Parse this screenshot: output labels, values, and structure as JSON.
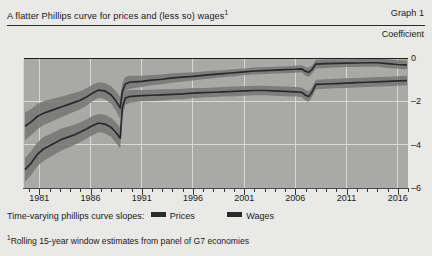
{
  "header": {
    "title": "A flatter Phillips curve for prices and (less so) wages",
    "title_footnote_marker": "1",
    "graph_number": "Graph 1",
    "unit_label": "Coefficient"
  },
  "legend": {
    "label": "Time-varying phillips curve slopes:",
    "entries": [
      {
        "name": "Prices",
        "color": "#2a2a2a"
      },
      {
        "name": "Wages",
        "color": "#2a2a2a"
      }
    ]
  },
  "footnote": {
    "marker": "1",
    "text": "Rolling 15-year window estimates from panel of G7 economies"
  },
  "chart_data": {
    "type": "line",
    "title": "A flatter Phillips curve for prices and (less so) wages",
    "xlabel": "",
    "ylabel": "Coefficient",
    "xlim": [
      1979.5,
      2017.0
    ],
    "ylim": [
      -6,
      0
    ],
    "yticks": [
      0,
      -2,
      -4,
      -6
    ],
    "ytick_labels": [
      "0",
      "–2",
      "–4",
      "–6"
    ],
    "xticks": [
      1981,
      1986,
      1991,
      1996,
      2001,
      2006,
      2011,
      2016
    ],
    "xtick_labels": [
      "1981",
      "1986",
      "1991",
      "1996",
      "2001",
      "2006",
      "2011",
      "2016"
    ],
    "xtick_minor_step": 1,
    "grid": true,
    "grid_color": "#d8d8d6",
    "zero_line": true,
    "legend_position": "below",
    "band_style": "shaded confidence band around central line",
    "series": [
      {
        "name": "Prices",
        "color": "#2a2a2a",
        "band_color": "#767674",
        "x": [
          1979.6,
          1980.2,
          1980.8,
          1981.4,
          1982.0,
          1982.6,
          1983.2,
          1983.8,
          1984.4,
          1985.0,
          1985.6,
          1986.2,
          1986.8,
          1987.4,
          1988.0,
          1988.5,
          1988.9,
          1989.1,
          1989.4,
          1989.8,
          1990.3,
          1991.0,
          1992.0,
          1993.0,
          1994.0,
          1995.0,
          1996.0,
          1997.0,
          1998.0,
          1999.0,
          2000.0,
          2001.0,
          2002.0,
          2003.0,
          2004.0,
          2005.0,
          2006.0,
          2006.6,
          2007.0,
          2007.3,
          2007.6,
          2008.0,
          2009.0,
          2010.0,
          2011.0,
          2012.0,
          2013.0,
          2014.0,
          2015.0,
          2016.0,
          2016.9
        ],
        "central": [
          -3.15,
          -2.95,
          -2.7,
          -2.55,
          -2.45,
          -2.35,
          -2.25,
          -2.15,
          -2.05,
          -1.95,
          -1.8,
          -1.62,
          -1.48,
          -1.52,
          -1.7,
          -2.0,
          -2.3,
          -1.55,
          -1.2,
          -1.12,
          -1.1,
          -1.08,
          -1.02,
          -0.98,
          -0.92,
          -0.88,
          -0.85,
          -0.8,
          -0.76,
          -0.72,
          -0.68,
          -0.64,
          -0.6,
          -0.58,
          -0.56,
          -0.54,
          -0.52,
          -0.5,
          -0.62,
          -0.66,
          -0.55,
          -0.28,
          -0.26,
          -0.25,
          -0.24,
          -0.23,
          -0.22,
          -0.22,
          -0.26,
          -0.3,
          -0.32
        ],
        "lower": [
          -3.8,
          -3.55,
          -3.3,
          -3.1,
          -2.98,
          -2.85,
          -2.72,
          -2.6,
          -2.48,
          -2.36,
          -2.2,
          -2.0,
          -1.84,
          -1.9,
          -2.1,
          -2.45,
          -2.8,
          -1.95,
          -1.52,
          -1.42,
          -1.38,
          -1.34,
          -1.26,
          -1.2,
          -1.14,
          -1.08,
          -1.04,
          -0.98,
          -0.93,
          -0.88,
          -0.84,
          -0.8,
          -0.76,
          -0.74,
          -0.72,
          -0.7,
          -0.68,
          -0.66,
          -0.82,
          -0.88,
          -0.74,
          -0.48,
          -0.46,
          -0.44,
          -0.42,
          -0.41,
          -0.4,
          -0.4,
          -0.46,
          -0.5,
          -0.52
        ],
        "upper": [
          -2.5,
          -2.35,
          -2.12,
          -2.0,
          -1.92,
          -1.85,
          -1.78,
          -1.7,
          -1.62,
          -1.54,
          -1.4,
          -1.24,
          -1.12,
          -1.15,
          -1.3,
          -1.55,
          -1.8,
          -1.15,
          -0.88,
          -0.82,
          -0.82,
          -0.82,
          -0.78,
          -0.76,
          -0.7,
          -0.68,
          -0.66,
          -0.62,
          -0.59,
          -0.56,
          -0.52,
          -0.48,
          -0.44,
          -0.42,
          -0.4,
          -0.38,
          -0.36,
          -0.34,
          -0.42,
          -0.44,
          -0.36,
          -0.08,
          -0.06,
          -0.06,
          -0.06,
          -0.05,
          -0.04,
          -0.04,
          -0.06,
          -0.1,
          -0.12
        ]
      },
      {
        "name": "Wages",
        "color": "#2a2a2a",
        "band_color": "#767674",
        "x": [
          1979.6,
          1980.2,
          1980.8,
          1981.4,
          1982.0,
          1982.6,
          1983.2,
          1983.8,
          1984.4,
          1985.0,
          1985.6,
          1986.2,
          1986.8,
          1987.4,
          1988.0,
          1988.5,
          1988.9,
          1989.1,
          1989.4,
          1989.8,
          1990.3,
          1991.0,
          1992.0,
          1993.0,
          1994.0,
          1995.0,
          1996.0,
          1997.0,
          1998.0,
          1999.0,
          2000.0,
          2001.0,
          2002.0,
          2003.0,
          2004.0,
          2005.0,
          2006.0,
          2006.6,
          2007.0,
          2007.3,
          2007.6,
          2008.0,
          2009.0,
          2010.0,
          2011.0,
          2012.0,
          2013.0,
          2014.0,
          2015.0,
          2016.0,
          2016.9
        ],
        "central": [
          -5.15,
          -4.85,
          -4.45,
          -4.2,
          -4.05,
          -3.9,
          -3.75,
          -3.65,
          -3.55,
          -3.42,
          -3.28,
          -3.12,
          -3.0,
          -3.05,
          -3.2,
          -3.45,
          -3.7,
          -2.3,
          -1.85,
          -1.78,
          -1.76,
          -1.74,
          -1.72,
          -1.7,
          -1.68,
          -1.66,
          -1.62,
          -1.6,
          -1.58,
          -1.56,
          -1.54,
          -1.52,
          -1.5,
          -1.5,
          -1.52,
          -1.54,
          -1.56,
          -1.58,
          -1.72,
          -1.78,
          -1.6,
          -1.22,
          -1.2,
          -1.18,
          -1.16,
          -1.14,
          -1.12,
          -1.1,
          -1.08,
          -1.06,
          -1.04
        ],
        "lower": [
          -5.7,
          -5.4,
          -5.0,
          -4.75,
          -4.58,
          -4.42,
          -4.26,
          -4.14,
          -4.02,
          -3.88,
          -3.72,
          -3.56,
          -3.42,
          -3.48,
          -3.64,
          -3.92,
          -4.18,
          -2.72,
          -2.16,
          -2.08,
          -2.04,
          -2.0,
          -1.98,
          -1.96,
          -1.92,
          -1.9,
          -1.86,
          -1.82,
          -1.8,
          -1.78,
          -1.76,
          -1.74,
          -1.72,
          -1.72,
          -1.74,
          -1.76,
          -1.78,
          -1.8,
          -1.96,
          -2.02,
          -1.82,
          -1.44,
          -1.42,
          -1.4,
          -1.38,
          -1.36,
          -1.34,
          -1.32,
          -1.3,
          -1.28,
          -1.26
        ],
        "upper": [
          -4.6,
          -4.3,
          -3.9,
          -3.65,
          -3.52,
          -3.38,
          -3.24,
          -3.16,
          -3.08,
          -2.96,
          -2.84,
          -2.68,
          -2.58,
          -2.62,
          -2.76,
          -2.98,
          -3.22,
          -1.88,
          -1.54,
          -1.48,
          -1.48,
          -1.48,
          -1.46,
          -1.44,
          -1.44,
          -1.42,
          -1.38,
          -1.38,
          -1.36,
          -1.34,
          -1.32,
          -1.3,
          -1.28,
          -1.28,
          -1.3,
          -1.32,
          -1.34,
          -1.36,
          -1.48,
          -1.54,
          -1.38,
          -1.0,
          -0.98,
          -0.96,
          -0.94,
          -0.92,
          -0.9,
          -0.88,
          -0.86,
          -0.84,
          -0.82
        ]
      }
    ]
  }
}
